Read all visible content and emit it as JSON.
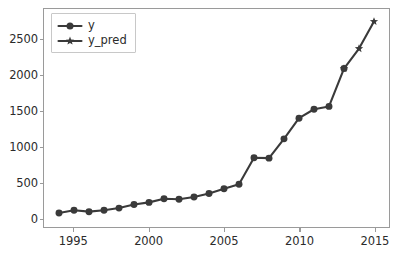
{
  "chart_data": {
    "type": "line",
    "title": "",
    "xlabel": "",
    "ylabel": "",
    "xlim": [
      1993.0,
      2016.0
    ],
    "ylim": [
      -130,
      2925
    ],
    "xticks": [
      1995,
      2000,
      2005,
      2010,
      2015
    ],
    "yticks": [
      0,
      500,
      1000,
      1500,
      2000,
      2500
    ],
    "grid": false,
    "legend_position": "upper left",
    "line_color": "#3a3a3a",
    "series": [
      {
        "name": "y",
        "marker": "circle",
        "color": "#3a3a3a",
        "x": [
          1994,
          1995,
          1996,
          1997,
          1998,
          1999,
          2000,
          2001,
          2002,
          2003,
          2004,
          2005,
          2006,
          2007,
          2008,
          2009,
          2010,
          2011,
          2012,
          2013
        ],
        "values": [
          65,
          105,
          85,
          105,
          135,
          185,
          215,
          265,
          260,
          290,
          340,
          405,
          470,
          840,
          835,
          1105,
          1395,
          1520,
          1560,
          2090
        ]
      },
      {
        "name": "y_pred",
        "marker": "star",
        "color": "#3a3a3a",
        "x": [
          2013,
          2014,
          2015
        ],
        "values": [
          2090,
          2370,
          2750
        ]
      }
    ]
  },
  "legend": {
    "entries": [
      {
        "label": "y",
        "marker": "circle"
      },
      {
        "label": "y_pred",
        "marker": "star"
      }
    ]
  },
  "axis": {
    "x_tick_labels": [
      "1995",
      "2000",
      "2005",
      "2010",
      "2015"
    ],
    "y_tick_labels": [
      "0",
      "500",
      "1000",
      "1500",
      "2000",
      "2500"
    ]
  }
}
